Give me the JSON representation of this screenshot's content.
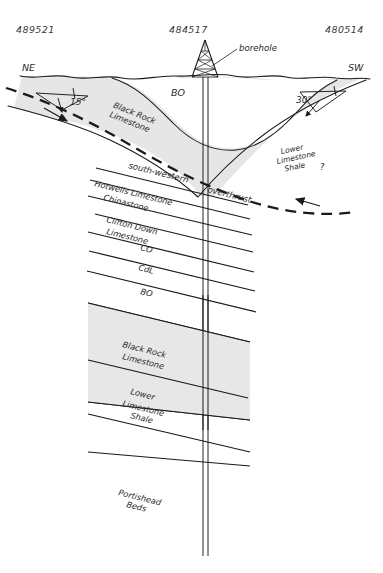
{
  "figure": {
    "type": "geological-cross-section",
    "width": 383,
    "height": 573,
    "background": "#ffffff"
  },
  "grid_references": {
    "left": "489521",
    "center": "484517",
    "right": "480514"
  },
  "compass": {
    "left": "NE",
    "right": "SW"
  },
  "annotations": {
    "borehole": "borehole",
    "thrust_line1": "south-western",
    "thrust_line2": "overthrust",
    "query_mark": "?"
  },
  "dip_symbols": [
    {
      "id": "dip-left",
      "angle": "15°"
    },
    {
      "id": "dip-right",
      "angle": "30°"
    }
  ],
  "surface_units": {
    "hanging_wall": {
      "l1": "Black Rock",
      "l2": "Limestone"
    },
    "syncline_core": "BO",
    "footwall": {
      "l1": "Lower",
      "l2": "Limestone",
      "l3": "Shale"
    }
  },
  "borehole_log": {
    "units": [
      {
        "id": "hotwells-limestone",
        "label": "Hotwells Limestone"
      },
      {
        "id": "chinastone",
        "label": "Chinastone"
      },
      {
        "id": "clifton-down-limestone",
        "l1": "Clifton Down",
        "l2": "Limestone"
      },
      {
        "id": "co",
        "label": "CO"
      },
      {
        "id": "cdl",
        "label": "CdL"
      },
      {
        "id": "bo",
        "label": "BO"
      },
      {
        "id": "black-rock-limestone",
        "l1": "Black Rock",
        "l2": "Limestone"
      },
      {
        "id": "lower-limestone-shale",
        "l1": "Lower",
        "l2": "Limestone",
        "l3": "Shale"
      },
      {
        "id": "portishead-beds",
        "l1": "Portishead",
        "l2": "Beds"
      }
    ]
  },
  "colors": {
    "shade_fill": "#e6e6e6",
    "line": "#1a1a1a",
    "text": "#2b2b2b",
    "grid_text": "#3a3a3a"
  }
}
